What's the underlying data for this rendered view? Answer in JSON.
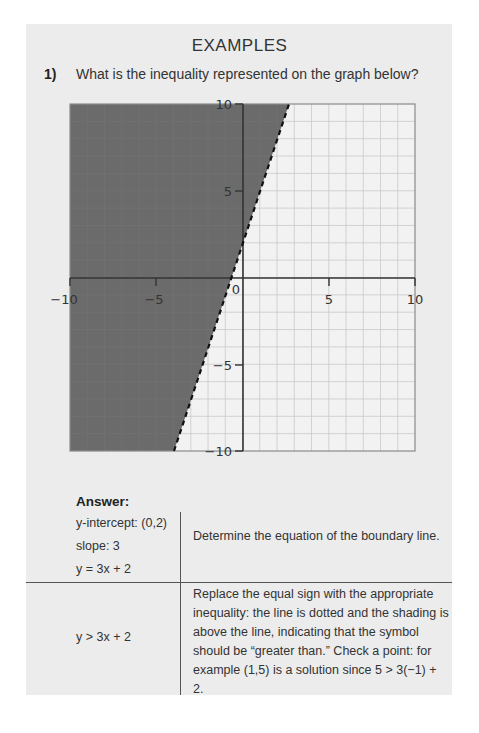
{
  "heading": "EXAMPLES",
  "question": {
    "number": "1)",
    "text": "What is the inequality represented on the graph below?"
  },
  "graph": {
    "x_ticks": [
      "−10",
      "−5",
      "5",
      "10"
    ],
    "y_ticks": [
      "10",
      "5",
      "−5",
      "−10"
    ],
    "origin_label": "0",
    "boundary_line": "y = 3x + 2",
    "line_style": "dashed",
    "shaded_region": "above/left of line",
    "colors": {
      "shade": "#6b6b6b",
      "grid": "#c8c8c8",
      "axis": "#333333",
      "line": "#111111"
    }
  },
  "chart_data": {
    "type": "line",
    "title": "",
    "xlabel": "",
    "ylabel": "",
    "xlim": [
      -10,
      10
    ],
    "ylim": [
      -10,
      10
    ],
    "grid": true,
    "x_ticks": [
      -10,
      -5,
      5,
      10
    ],
    "y_ticks": [
      -10,
      -5,
      5,
      10
    ],
    "series": [
      {
        "name": "y = 3x + 2 (boundary, dashed)",
        "x": [
          -4,
          2.6667
        ],
        "y": [
          -10,
          10
        ]
      }
    ],
    "shaded": "region where y > 3x + 2"
  },
  "answer": {
    "label": "Answer:",
    "rows": [
      {
        "left": [
          "y-intercept: (0,2)",
          "slope: 3",
          "y = 3x + 2"
        ],
        "right": "Determine the equation of the boundary line."
      },
      {
        "left": [
          "y > 3x + 2"
        ],
        "right": "Replace the equal sign with the appropriate inequality: the line is dotted and the shading is above the line, indicating that the symbol should be “greater than.” Check a point: for example (1,5) is a solution since 5 > 3(−1) + 2."
      }
    ]
  }
}
